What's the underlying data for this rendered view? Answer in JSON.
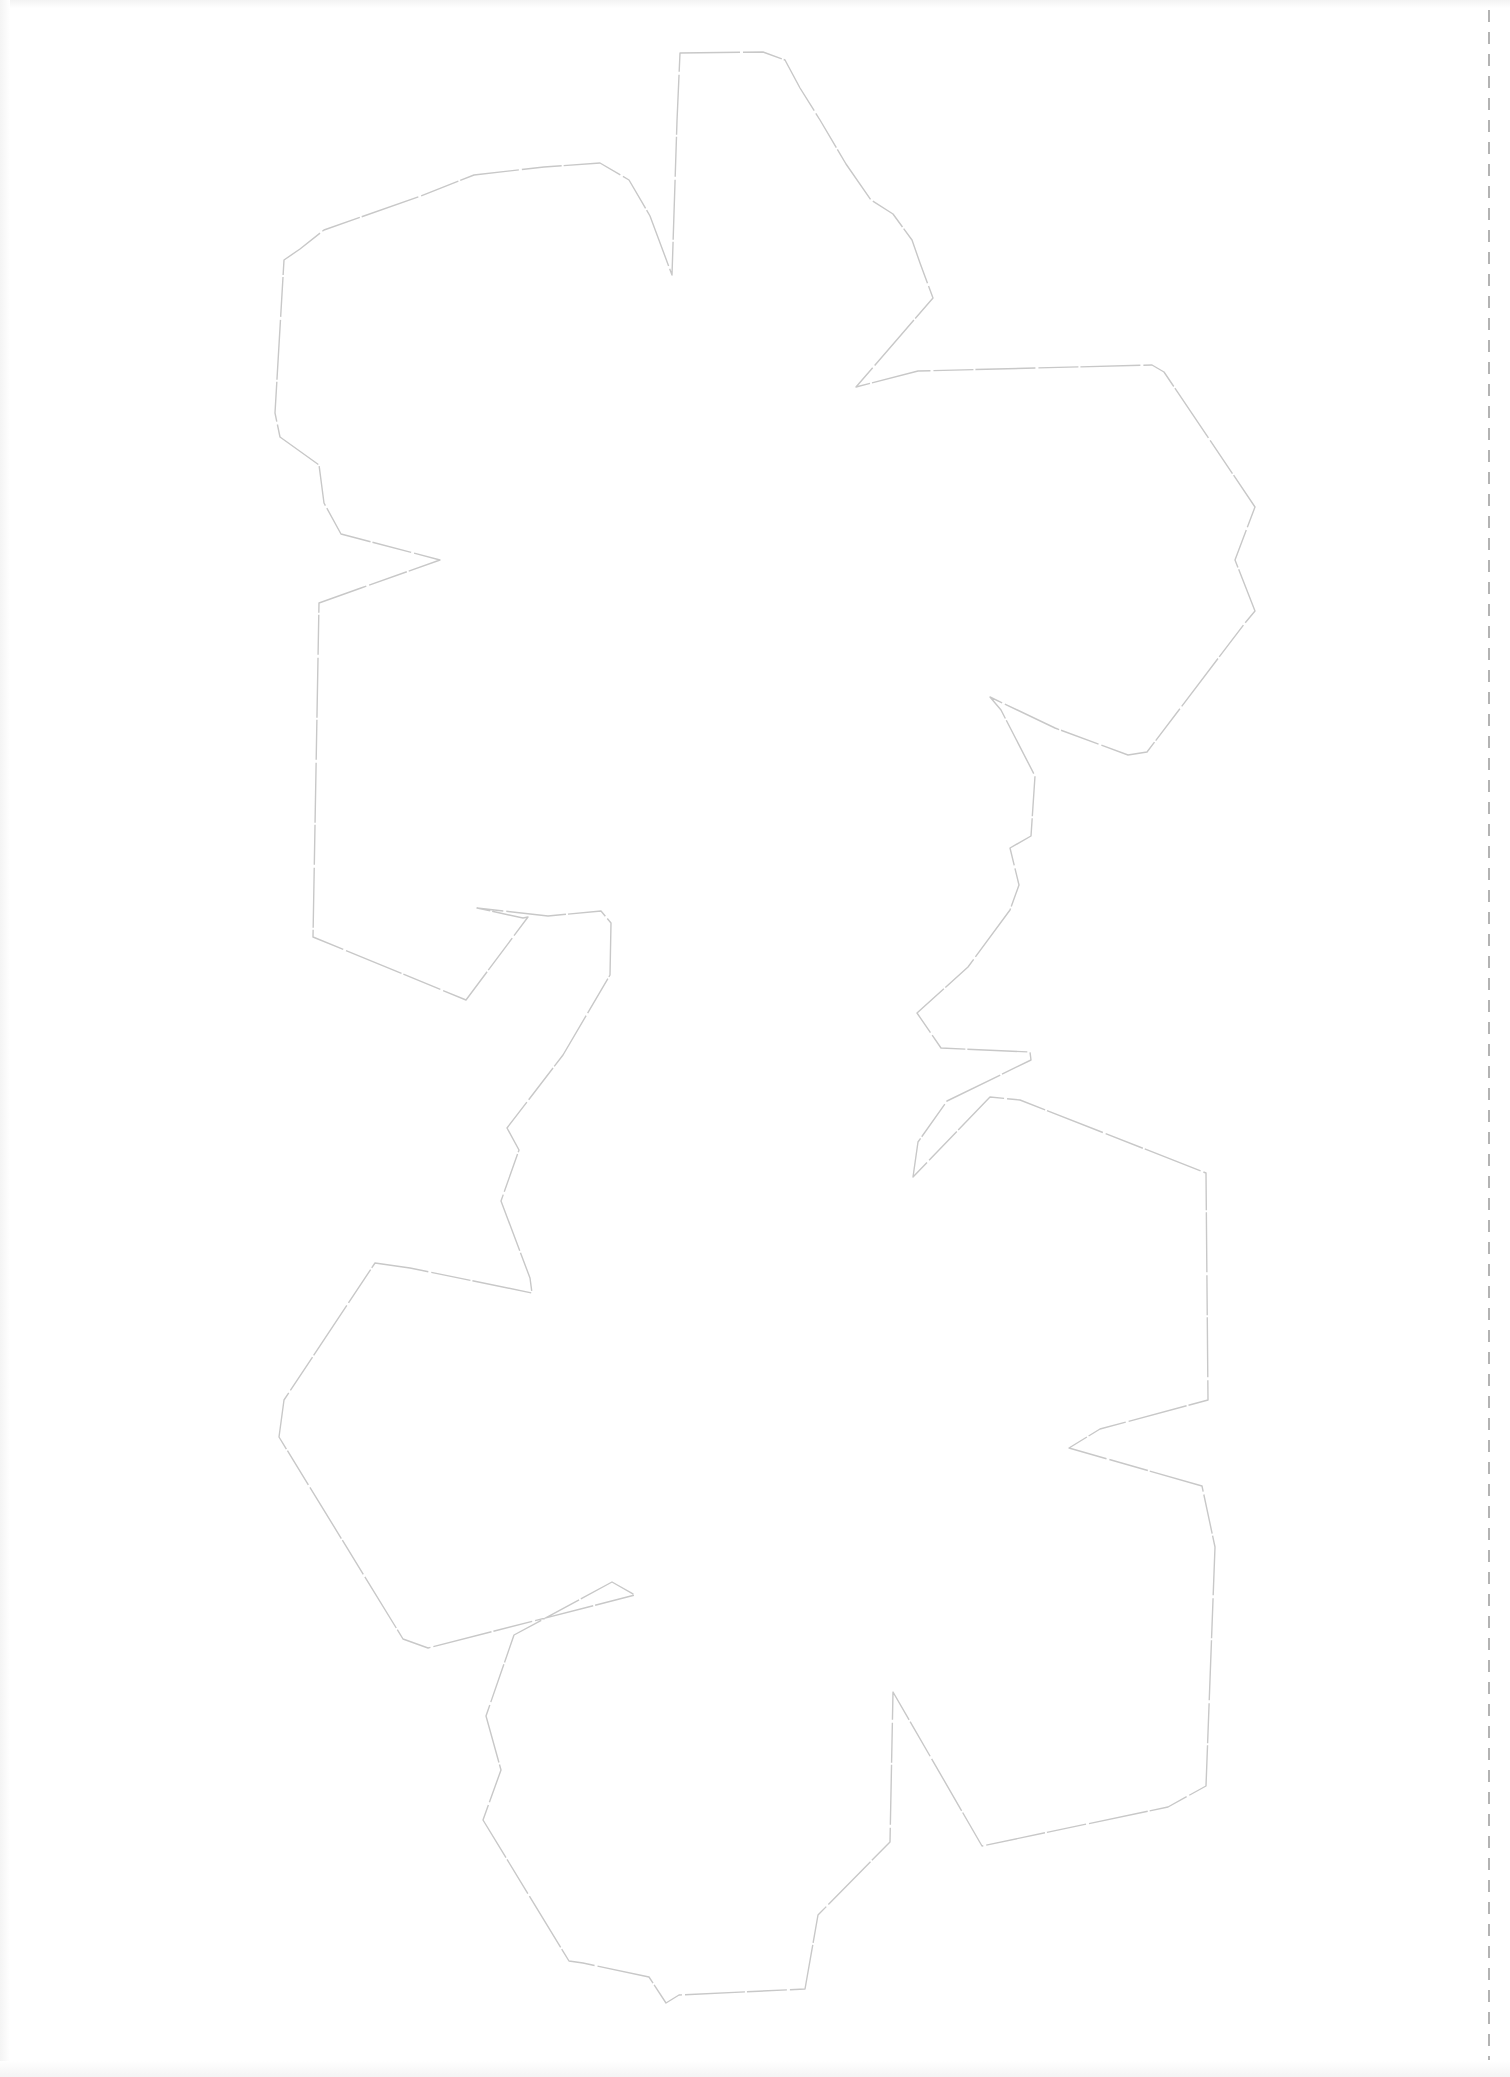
{
  "sheet": {
    "background": "#ffffff",
    "outline_color": "#c8c8c8",
    "fold_line_color": "#9a9a9a",
    "fold_line_x": 1489
  },
  "net_outline": {
    "shape": "dodecahedron-net-cutout",
    "points": "680,53 763,52 785,60 800,88 820,120 846,164 871,200 893,214 912,240 920,263 933,298 901,335 856,387 918,371 1152,365 1164,372 1255,507 1235,560 1255,611 1245,623 1147,752 1128,755 1055,728 990,697 1001,710 1035,776 1031,836 1010,848 1019,885 1010,910 968,967 917,1013 941,1048 1030,1052 1031,1060 947,1101 918,1142 913,1177 990,1097 1020,1100 1206,1173 1208,1400 1100,1429 1069,1448 1202,1486 1215,1547 1206,1786 1168,1807 982,1846 893,1692 890,1842 818,1915 805,1989 679,1995 666,2003 649,1977 583,1963 569,1961 483,1820 501,1770 486,1716 514,1635 612,1582 635,1595 428,1648 403,1639 279,1437 284,1400 375,1263 410,1268 532,1293 530,1278 501,1201 519,1150 507,1128 563,1055 610,975 611,923 601,911 548,916 477,908 523,918 528,917 466,1000 313,937 319,603 361,588 440,560 341,534 324,503 319,465 280,437 275,413 284,260 300,249 324,230 421,196 474,175 544,167 600,163 629,180 650,216 672,275 677,121"
  }
}
